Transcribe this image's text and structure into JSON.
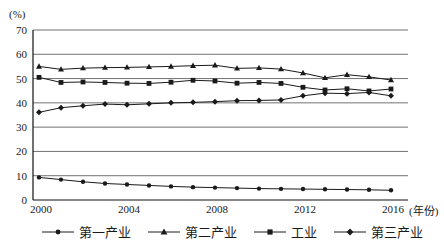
{
  "chart_data": {
    "type": "line",
    "title": "",
    "xlabel": "(年份)",
    "ylabel": "(%)",
    "xlim": [
      2000,
      2016
    ],
    "ylim": [
      0,
      70
    ],
    "grid": "horizontal",
    "legend_position": "bottom",
    "line_color": "#1a1a1a",
    "grid_color": "#4d4d4d",
    "y_ticks": [
      0,
      10,
      20,
      30,
      40,
      50,
      60,
      70
    ],
    "x_tick_labels": [
      "2000",
      "2004",
      "2008",
      "2012",
      "2016"
    ],
    "x_tick_years": [
      2000,
      2004,
      2008,
      2012,
      2016
    ],
    "x": [
      2000,
      2001,
      2002,
      2003,
      2004,
      2005,
      2006,
      2007,
      2008,
      2009,
      2010,
      2011,
      2012,
      2013,
      2014,
      2015,
      2016
    ],
    "series": [
      {
        "name": "第一产业",
        "marker": "circle",
        "values": [
          9.3,
          8.4,
          7.5,
          6.8,
          6.4,
          6.0,
          5.6,
          5.3,
          5.1,
          4.9,
          4.7,
          4.6,
          4.5,
          4.4,
          4.3,
          4.2,
          4.0
        ]
      },
      {
        "name": "第二产业",
        "marker": "triangle",
        "values": [
          55.0,
          53.8,
          54.3,
          54.5,
          54.6,
          54.8,
          55.0,
          55.3,
          55.5,
          54.2,
          54.4,
          53.9,
          52.3,
          50.3,
          51.6,
          50.7,
          49.4
        ]
      },
      {
        "name": "工业",
        "marker": "square",
        "values": [
          50.5,
          48.4,
          48.6,
          48.4,
          48.1,
          48.0,
          48.5,
          49.3,
          49.0,
          48.1,
          48.4,
          48.0,
          46.4,
          45.3,
          45.8,
          44.9,
          45.7
        ]
      },
      {
        "name": "第三产业",
        "marker": "diamond",
        "values": [
          36.1,
          38.0,
          38.8,
          39.5,
          39.2,
          39.6,
          40.0,
          40.2,
          40.5,
          40.9,
          41.0,
          41.2,
          42.9,
          44.0,
          43.8,
          44.3,
          42.9
        ]
      }
    ]
  }
}
